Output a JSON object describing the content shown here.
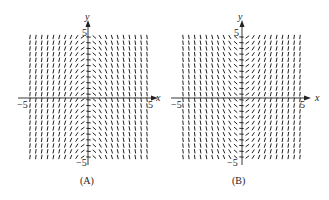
{
  "panels": [
    {
      "id": "A",
      "caption": "(A)",
      "x_axis_label": "x",
      "y_axis_label": "y",
      "tick_neg_x": "−5",
      "tick_pos_x": "5",
      "tick_pos_y": "5",
      "tick_neg_y": "−5",
      "slope_rule": "negative-x",
      "description": "Slope field: steep positive slopes for x<0, nearly horizontal near y-axis, steep negative slopes for x>0"
    },
    {
      "id": "B",
      "caption": "(B)",
      "x_axis_label": "x",
      "y_axis_label": "y",
      "tick_neg_x": "−5",
      "tick_pos_x": "5",
      "tick_pos_y": "5",
      "tick_neg_y": "−5",
      "slope_rule": "positive-x",
      "description": "Slope field: steep negative slopes for x<0, nearly horizontal near y-axis, steep positive slopes for x>0"
    }
  ],
  "colors": {
    "ink": "#222222",
    "background": "#ffffff"
  }
}
